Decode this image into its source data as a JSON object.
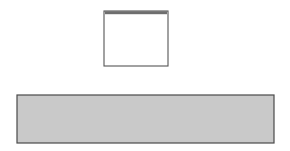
{
  "figure": {
    "name": "fold-and-scallop-pattern-figure",
    "background_color": "#ffffff",
    "width": 290,
    "height": 151
  },
  "fold_panel": {
    "name": "fold-diagram",
    "box": {
      "x": 104,
      "y": 11,
      "width": 64,
      "height": 55
    },
    "border_color": "#555555",
    "fill_color": "#ffffff",
    "top_band": {
      "name": "fold-crease-band",
      "color": "#6e6e6e",
      "height": 3,
      "label": "Fold"
    },
    "label": {
      "text": "Fold",
      "rotation": 90,
      "color": "#2b2b2b",
      "x": 175,
      "y": 30
    },
    "curve": {
      "name": "fold-curve",
      "style": "dotted",
      "color": "#777777",
      "description": "concave rising curve from lower-left to upper-right",
      "points": [
        [
          108,
          63
        ],
        [
          112,
          57
        ],
        [
          117,
          51
        ],
        [
          122,
          46
        ],
        [
          128,
          41
        ],
        [
          134,
          37
        ],
        [
          141,
          33
        ],
        [
          148,
          30
        ],
        [
          155,
          28
        ],
        [
          162,
          26
        ],
        [
          166,
          25
        ]
      ]
    }
  },
  "scallop_panel": {
    "name": "scallop-pattern-panel",
    "box": {
      "x": 17,
      "y": 95,
      "width": 257,
      "height": 48
    },
    "border_color": "#4a4a4a",
    "background_color": "#c9c9c9",
    "arc_fill": "#9a9a9a",
    "wedge_fill_light": "#ebebeb",
    "wedge_fill_mid": "#d8d8d8",
    "wedge_fill_dark": "#b5b5b5",
    "line_color": "#3c3c3c",
    "scallop_count": 5,
    "half_scallops": 2,
    "scallop_centers_x": [
      17,
      68,
      120,
      171,
      223,
      274
    ],
    "scallop_radius": 26,
    "baseline_y": 143,
    "wedges_per_scallop": 4,
    "wedge_shades": [
      [
        "mid",
        "light",
        "mid",
        "light"
      ],
      [
        "dark",
        "light",
        "mid",
        "light"
      ],
      [
        "light",
        "mid",
        "light",
        "mid"
      ],
      [
        "mid",
        "light",
        "dark",
        "light"
      ],
      [
        "light",
        "mid",
        "light",
        "mid"
      ],
      [
        "dark",
        "light"
      ]
    ]
  }
}
